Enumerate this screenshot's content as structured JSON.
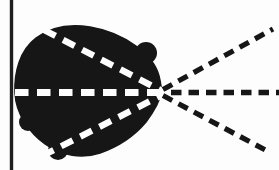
{
  "figure": {
    "background_color": "#fdfdfd",
    "ink_color": "#161616",
    "white_color": "#fdfdfd",
    "canvas": {
      "width": 279,
      "height": 170
    },
    "border_line": {
      "x": 11.5,
      "y1": 0,
      "y2": 170,
      "width": 3.4,
      "color": "#1e1e1e"
    },
    "eye": {
      "path": "M 15 93 C 14 72 20 50 36 38 C 52 26 72 24 90 27 C 108 30 122 36 136 46 C 147 54 156 64 159 76 C 161 84 162 88 161 93 C 160 100 155 110 146 122 C 136 134 120 146 100 153 C 82 159 62 156 45 144 C 30 133 16 115 15 93 Z",
      "bumps": [
        {
          "cx": 146,
          "cy": 53,
          "r": 11
        },
        {
          "cx": 58,
          "cy": 150,
          "r": 10
        },
        {
          "cx": 28,
          "cy": 122,
          "r": 9
        }
      ],
      "color": "#161616"
    },
    "rays": [
      {
        "name": "axial-ray-internal",
        "x1": 15,
        "y1": 92.5,
        "x2": 166,
        "y2": 92.5,
        "stroke": "#fdfdfd",
        "width": 6.8,
        "dash": "13.5 8.5"
      },
      {
        "name": "upper-ray-internal",
        "x1": 44,
        "y1": 30,
        "x2": 166,
        "y2": 93,
        "stroke": "#fdfdfd",
        "width": 6.4,
        "dash": "13 8.5"
      },
      {
        "name": "lower-ray-internal",
        "x1": 42,
        "y1": 156,
        "x2": 166,
        "y2": 93,
        "stroke": "#fdfdfd",
        "width": 6.4,
        "dash": "13 8.5"
      },
      {
        "name": "axial-ray-external",
        "x1": 171,
        "y1": 92.5,
        "x2": 279,
        "y2": 92.5,
        "stroke": "#161616",
        "width": 5.4,
        "dash": "10.5 7"
      },
      {
        "name": "upper-ray-external",
        "x1": 163,
        "y1": 89.5,
        "x2": 273,
        "y2": 29,
        "stroke": "#161616",
        "width": 5.2,
        "dash": "10.5 7"
      },
      {
        "name": "lower-ray-external",
        "x1": 163,
        "y1": 95.5,
        "x2": 271,
        "y2": 153,
        "stroke": "#161616",
        "width": 5.2,
        "dash": "10.5 7"
      }
    ]
  }
}
